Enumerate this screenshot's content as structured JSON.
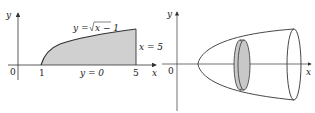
{
  "figure": {
    "left": {
      "axis_x_label": "x",
      "axis_y_label": "y",
      "origin_label": "0",
      "tick_1": "1",
      "tick_5": "5",
      "curve_label": "y = √x − 1",
      "curve_label_prefix": "y = ",
      "curve_label_radicand": "x − 1",
      "line_label_right": "x = 5",
      "line_label_bottom": "y = 0"
    },
    "right": {
      "axis_x_label": "x",
      "axis_y_label": "y",
      "origin_label": "0"
    },
    "colors": {
      "shade": "#d0d0d0",
      "line": "#333333"
    }
  }
}
